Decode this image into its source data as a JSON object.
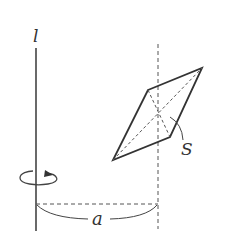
{
  "diagram": {
    "axis_label": "l",
    "area_label": "S",
    "distance_label": "a",
    "colors": {
      "stroke": "#333333",
      "dashed": "#555555",
      "background": "#ffffff"
    },
    "elements": {
      "axis": "rotation axis l (vertical solid line)",
      "rotation_indicator": "circular arrow around axis",
      "parallelogram": "plane figure with area S and dashed diagonals",
      "parallel_line": "dashed vertical line through parallelogram center",
      "distance": "dashed horizontal segment with brace labeled a"
    }
  }
}
